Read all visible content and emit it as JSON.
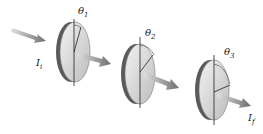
{
  "diagram": {
    "type": "polarizer-series",
    "incident_intensity": {
      "symbol": "I",
      "subscript": "i"
    },
    "final_intensity": {
      "symbol": "I",
      "subscript": "f"
    },
    "polarizers": [
      {
        "angle_symbol": "θ",
        "subscript": "1"
      },
      {
        "angle_symbol": "θ",
        "subscript": "2"
      },
      {
        "angle_symbol": "θ",
        "subscript": "3"
      }
    ],
    "colors": {
      "arrow": "#8a8a8a",
      "disc_face": "#e2e2e2",
      "disc_rim": "#555555",
      "axis": "#222222"
    }
  }
}
